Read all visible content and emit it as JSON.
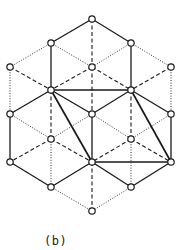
{
  "caption": "(b)",
  "colors": {
    "line": "#1a1a1a",
    "node_fill": "#ffffff",
    "background": "#ffffff"
  },
  "node_radius": 3.2,
  "nodes": [
    {
      "id": "n0",
      "x": 92,
      "y": 19
    },
    {
      "id": "n1",
      "x": 51,
      "y": 43
    },
    {
      "id": "n2",
      "x": 131,
      "y": 43
    },
    {
      "id": "n3",
      "x": 10,
      "y": 67
    },
    {
      "id": "n4",
      "x": 92,
      "y": 67
    },
    {
      "id": "n5",
      "x": 171,
      "y": 67
    },
    {
      "id": "n6",
      "x": 51,
      "y": 90
    },
    {
      "id": "n7",
      "x": 131,
      "y": 90
    },
    {
      "id": "n8",
      "x": 10,
      "y": 114
    },
    {
      "id": "n9",
      "x": 92,
      "y": 114
    },
    {
      "id": "n10",
      "x": 171,
      "y": 114
    },
    {
      "id": "n11",
      "x": 51,
      "y": 139
    },
    {
      "id": "n12",
      "x": 131,
      "y": 139
    },
    {
      "id": "n13",
      "x": 10,
      "y": 162
    },
    {
      "id": "n14",
      "x": 92,
      "y": 162
    },
    {
      "id": "n15",
      "x": 171,
      "y": 162
    },
    {
      "id": "n16",
      "x": 51,
      "y": 187
    },
    {
      "id": "n17",
      "x": 131,
      "y": 187
    },
    {
      "id": "n18",
      "x": 92,
      "y": 211
    }
  ],
  "edges": [
    {
      "from": "n0",
      "to": "n1",
      "style": "solid"
    },
    {
      "from": "n0",
      "to": "n2",
      "style": "solid"
    },
    {
      "from": "n0",
      "to": "n4",
      "style": "dashed"
    },
    {
      "from": "n1",
      "to": "n4",
      "style": "dotted"
    },
    {
      "from": "n2",
      "to": "n4",
      "style": "dotted"
    },
    {
      "from": "n1",
      "to": "n3",
      "style": "dotted"
    },
    {
      "from": "n2",
      "to": "n5",
      "style": "dotted"
    },
    {
      "from": "n1",
      "to": "n6",
      "style": "solid"
    },
    {
      "from": "n2",
      "to": "n7",
      "style": "solid"
    },
    {
      "from": "n3",
      "to": "n6",
      "style": "dashed"
    },
    {
      "from": "n4",
      "to": "n6",
      "style": "dashed"
    },
    {
      "from": "n4",
      "to": "n7",
      "style": "dashed"
    },
    {
      "from": "n5",
      "to": "n7",
      "style": "dashed"
    },
    {
      "from": "n3",
      "to": "n8",
      "style": "dotted"
    },
    {
      "from": "n4",
      "to": "n9",
      "style": "dashed"
    },
    {
      "from": "n5",
      "to": "n10",
      "style": "dotted"
    },
    {
      "from": "n6",
      "to": "n7",
      "style": "thick"
    },
    {
      "from": "n6",
      "to": "n8",
      "style": "solid"
    },
    {
      "from": "n6",
      "to": "n9",
      "style": "solid"
    },
    {
      "from": "n7",
      "to": "n9",
      "style": "solid"
    },
    {
      "from": "n7",
      "to": "n10",
      "style": "solid"
    },
    {
      "from": "n6",
      "to": "n11",
      "style": "dashed"
    },
    {
      "from": "n7",
      "to": "n12",
      "style": "dashed"
    },
    {
      "from": "n6",
      "to": "n14",
      "style": "thick"
    },
    {
      "from": "n7",
      "to": "n15",
      "style": "thick"
    },
    {
      "from": "n8",
      "to": "n11",
      "style": "dotted"
    },
    {
      "from": "n9",
      "to": "n11",
      "style": "dotted"
    },
    {
      "from": "n9",
      "to": "n12",
      "style": "dotted"
    },
    {
      "from": "n10",
      "to": "n12",
      "style": "dotted"
    },
    {
      "from": "n8",
      "to": "n13",
      "style": "solid"
    },
    {
      "from": "n9",
      "to": "n14",
      "style": "solid"
    },
    {
      "from": "n10",
      "to": "n15",
      "style": "solid"
    },
    {
      "from": "n11",
      "to": "n13",
      "style": "dashed"
    },
    {
      "from": "n11",
      "to": "n14",
      "style": "dashed"
    },
    {
      "from": "n12",
      "to": "n14",
      "style": "dashed"
    },
    {
      "from": "n12",
      "to": "n15",
      "style": "dashed"
    },
    {
      "from": "n14",
      "to": "n15",
      "style": "thick"
    },
    {
      "from": "n11",
      "to": "n16",
      "style": "dotted"
    },
    {
      "from": "n12",
      "to": "n17",
      "style": "dotted"
    },
    {
      "from": "n13",
      "to": "n16",
      "style": "solid"
    },
    {
      "from": "n14",
      "to": "n16",
      "style": "solid"
    },
    {
      "from": "n14",
      "to": "n17",
      "style": "solid"
    },
    {
      "from": "n15",
      "to": "n17",
      "style": "solid"
    },
    {
      "from": "n14",
      "to": "n18",
      "style": "dashed"
    },
    {
      "from": "n16",
      "to": "n18",
      "style": "dotted"
    },
    {
      "from": "n17",
      "to": "n18",
      "style": "dotted"
    }
  ]
}
